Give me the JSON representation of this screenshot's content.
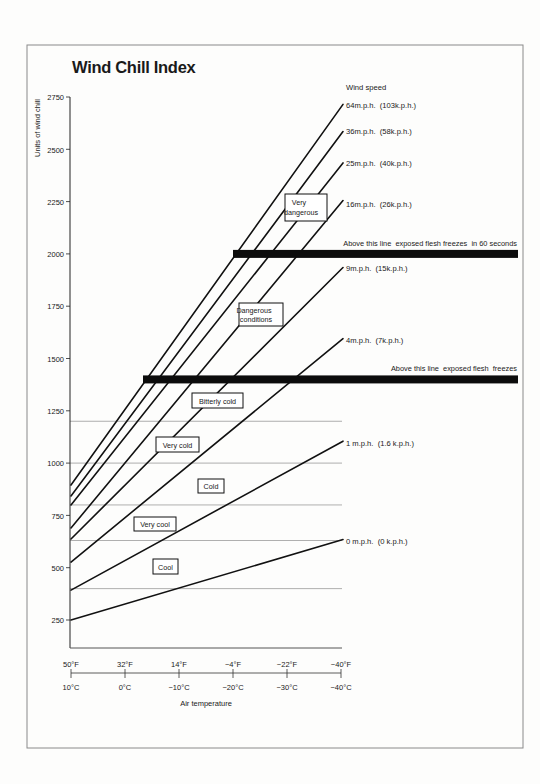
{
  "page": {
    "title": "Wind Chill Index"
  },
  "y_axis": {
    "label": "Units of wind chill",
    "ticks": [
      "2750",
      "2500",
      "2250",
      "2000",
      "1750",
      "1500",
      "1250",
      "1000",
      "750",
      "500",
      "250"
    ]
  },
  "x_axis": {
    "label": "Air temperature",
    "fahrenheit_ticks": [
      "50°F",
      "32°F",
      "14°F",
      "−4°F",
      "−22°F",
      "−40°F"
    ],
    "celsius_ticks": [
      "10°C",
      "0°C",
      "−10°C",
      "−20°C",
      "−30°C",
      "−40°C"
    ]
  },
  "legend": {
    "title": "Wind speed",
    "labels": [
      "64m.p.h.  (103k.p.h.)",
      "36m.p.h.  (58k.p.h.)",
      "25m.p.h.  (40k.p.h.)",
      "16m.p.h.  (26k.p.h.)",
      "9m.p.h.  (15k.p.h.)",
      "4m.p.h.  (7k.p.h.)",
      "1 m.p.h.  (1.6 k.p.h.)",
      "0 m.p.h.  (0 k.p.h.)"
    ]
  },
  "thresholds": [
    {
      "label": "Above this line  exposed flesh freezes  in 60 seconds"
    },
    {
      "label": "Above this line  exposed flesh  freezes"
    }
  ],
  "zones": [
    {
      "lines": [
        "Very",
        "dangerous"
      ]
    },
    {
      "lines": [
        "Dangerous",
        "conditions"
      ]
    },
    {
      "lines": [
        "Bitterly cold"
      ]
    },
    {
      "lines": [
        "Very cold"
      ]
    },
    {
      "lines": [
        "Cold"
      ]
    },
    {
      "lines": [
        "Very cool"
      ]
    },
    {
      "lines": [
        "Cool"
      ]
    }
  ],
  "chart_data": {
    "type": "line",
    "title": "Wind Chill Index",
    "xlabel": "Air temperature",
    "ylabel": "Units of wind chill",
    "x_unit": "°F",
    "x": [
      50,
      -40
    ],
    "x_ticks_f": [
      50,
      32,
      14,
      -4,
      -22,
      -40
    ],
    "x_ticks_c": [
      10,
      0,
      -10,
      -20,
      -30,
      -40
    ],
    "ylim": [
      250,
      2750
    ],
    "y_ticks": [
      2750,
      2500,
      2250,
      2000,
      1750,
      1500,
      1250,
      1000,
      750,
      500,
      250
    ],
    "grid": false,
    "legend_title": "Wind speed",
    "legend_position": "right (labels at line ends)",
    "series": [
      {
        "name": "64 m.p.h. (103 k.p.h.)",
        "wind_mph": 64,
        "wind_kph": 103,
        "values": [
          895,
          2710
        ]
      },
      {
        "name": "36 m.p.h. (58 k.p.h.)",
        "wind_mph": 36,
        "wind_kph": 58,
        "values": [
          843,
          2580
        ]
      },
      {
        "name": "25 m.p.h. (40 k.p.h.)",
        "wind_mph": 25,
        "wind_kph": 40,
        "values": [
          800,
          2430
        ]
      },
      {
        "name": "16 m.p.h. (26 k.p.h.)",
        "wind_mph": 16,
        "wind_kph": 26,
        "values": [
          690,
          2250
        ]
      },
      {
        "name": "9 m.p.h. (15 k.p.h.)",
        "wind_mph": 9,
        "wind_kph": 15,
        "values": [
          637,
          1930
        ]
      },
      {
        "name": "4 m.p.h. (7 k.p.h.)",
        "wind_mph": 4,
        "wind_kph": 7,
        "values": [
          527,
          1590
        ]
      },
      {
        "name": "1 m.p.h. (1.6 k.p.h.)",
        "wind_mph": 1,
        "wind_kph": 1.6,
        "values": [
          393,
          1100
        ]
      },
      {
        "name": "0 m.p.h. (0 k.p.h.)",
        "wind_mph": 0,
        "wind_kph": 0,
        "values": [
          250,
          630
        ]
      }
    ],
    "reference_lines": [
      400,
      630,
      800,
      1000,
      1200
    ],
    "thresholds": [
      {
        "value": 2000,
        "start_x": -4,
        "label": "Above this line exposed flesh freezes in 60 seconds"
      },
      {
        "value": 1400,
        "start_x": 26,
        "label": "Above this line exposed flesh freezes"
      }
    ],
    "zones": [
      {
        "label": "Very dangerous",
        "range": [
          2000,
          null
        ]
      },
      {
        "label": "Dangerous conditions",
        "range": [
          1400,
          2000
        ]
      },
      {
        "label": "Bitterly cold",
        "range": [
          1200,
          1400
        ]
      },
      {
        "label": "Very cold",
        "range": [
          1000,
          1200
        ]
      },
      {
        "label": "Cold",
        "range": [
          800,
          1000
        ]
      },
      {
        "label": "Very cool",
        "range": [
          630,
          800
        ]
      },
      {
        "label": "Cool",
        "range": [
          400,
          630
        ]
      }
    ]
  }
}
